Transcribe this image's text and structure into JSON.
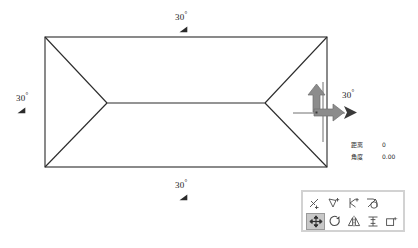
{
  "app": {
    "title": "CAD Roof Plan Editor"
  },
  "drawing": {
    "name": "hip-roof-plan",
    "description": "Rectangular hip roof plan with four sloped planes and a central ridge line",
    "line_color": "#2b2b2b",
    "outline": {
      "top_left": [
        45,
        37
      ],
      "top_right": [
        327,
        37
      ],
      "bottom_right": [
        327,
        167
      ],
      "bottom_left": [
        45,
        167
      ]
    },
    "ridge": {
      "left_vertex": [
        107,
        103
      ],
      "right_vertex": [
        265,
        103
      ]
    }
  },
  "annotations": {
    "degree_symbol": "°",
    "items": [
      {
        "id": "angle-top",
        "value": "30",
        "position": "top",
        "mark": "angle-mark-icon"
      },
      {
        "id": "angle-left",
        "value": "30",
        "position": "left",
        "mark": "angle-mark-icon"
      },
      {
        "id": "angle-bottom",
        "value": "30",
        "position": "bottom",
        "mark": "angle-mark-icon"
      },
      {
        "id": "angle-right",
        "value": "30",
        "position": "right",
        "mark": "angle-mark-icon"
      }
    ]
  },
  "cursor": {
    "name": "ucs-move-cursor",
    "arrow_color": "#8a8a8a",
    "crosshair_color": "#4d4d4d",
    "pointer": "arrow-pointer-icon",
    "up_arrow": "arrow-up-icon",
    "right_arrow": "arrow-right-icon"
  },
  "readout": {
    "rows": [
      {
        "label": "距离",
        "value": "0"
      },
      {
        "label": "角度",
        "value": "0.00"
      }
    ]
  },
  "toolbar": {
    "name": "modify-toolbar",
    "rows": [
      {
        "buttons": [
          {
            "id": "erase",
            "icon": "erase-icon",
            "label": "删除",
            "active": false
          },
          {
            "id": "copy",
            "icon": "copy-icon",
            "label": "复制",
            "active": false
          },
          {
            "id": "trim",
            "icon": "trim-icon",
            "label": "修剪",
            "active": false
          },
          {
            "id": "fillet",
            "icon": "fillet-icon",
            "label": "圆角",
            "active": false
          }
        ]
      },
      {
        "buttons": [
          {
            "id": "move",
            "icon": "move-icon",
            "label": "移动",
            "active": true
          },
          {
            "id": "rotate",
            "icon": "rotate-icon",
            "label": "旋转",
            "active": false
          },
          {
            "id": "mirror",
            "icon": "mirror-icon",
            "label": "镜像",
            "active": false
          },
          {
            "id": "scale",
            "icon": "scale-icon",
            "label": "缩放",
            "active": false
          },
          {
            "id": "array",
            "icon": "array-icon",
            "label": "阵列",
            "active": false
          }
        ]
      }
    ]
  },
  "colors": {
    "background": "#ffffff",
    "line": "#2b2b2b",
    "toolbar_border": "#d2d2d2",
    "active_button": "#c8c8c8",
    "arrow_gray": "#8a8a8a",
    "text": "#1a1a1a"
  }
}
